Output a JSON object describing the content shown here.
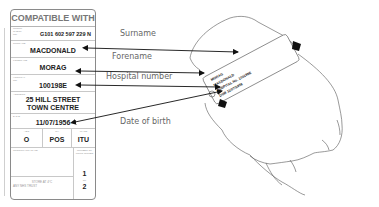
{
  "card": {
    "title": "COMPATIBLE WITH",
    "group": {
      "label": "GROUP CHECK No.",
      "value": "G101 602 597 229  N"
    },
    "surname": {
      "label": "SURNAME",
      "value": "MACDONALD"
    },
    "forename": {
      "label": "FORENAME",
      "value": "MORAG"
    },
    "hospital": {
      "label": "HOSPITAL No.",
      "value": "100198E"
    },
    "address": {
      "label": "ADDRESS",
      "line1": "25 HILL STREET",
      "line2": "TOWN CENTRE"
    },
    "dob": {
      "label": "D.O.B.",
      "value": "11/07/1956"
    },
    "blood": {
      "abo": {
        "label": "ABO",
        "value": "O"
      },
      "rh": {
        "label": "Rh",
        "value": "POS"
      },
      "ward": {
        "label": "WARD",
        "value": "ITU"
      }
    },
    "crossmatch": {
      "label": "CROSSMATCH DATE"
    },
    "units": {
      "label": "NUMBER OF UNITS ISSUED",
      "value1": "1",
      "of": "OF",
      "value2": "2"
    },
    "store": {
      "line1": "STORE AT 4°C",
      "line2": "ANY NHS TRUST"
    }
  },
  "labels": {
    "surname": "Surname",
    "forename": "Forename",
    "hospital_number": "Hospital number",
    "dob": "Date of birth"
  },
  "wristband": {
    "line1": "MORAG",
    "line2": "MACDONALD",
    "line3": "HOSPITAL No. 100198E",
    "line4": "DOB 11/07/1956"
  }
}
